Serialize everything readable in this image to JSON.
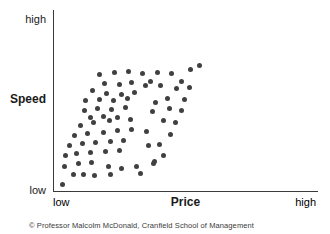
{
  "chart": {
    "y_axis": {
      "top_tick": "high",
      "label": "Speed",
      "bottom_tick": "low"
    },
    "x_axis": {
      "left_tick": "low",
      "label": "Price",
      "right_tick": "high"
    },
    "footer": "© Professor Malcolm McDonald, Cranfield School of Management",
    "colors": {
      "background": "#ffffff",
      "dot": "#404040",
      "axis": "#3a3a3a",
      "text": "#1a1a1a",
      "footer_text": "#3a3a3a"
    }
  },
  "chart_data": {
    "type": "scatter",
    "title": "",
    "xlabel": "Price",
    "ylabel": "Speed",
    "x_range_labels": [
      "low",
      "high"
    ],
    "y_range_labels": [
      "low",
      "high"
    ],
    "axes_quantitative": false,
    "x_range": [
      0,
      1
    ],
    "y_range": [
      0,
      1
    ],
    "grid": false,
    "legend": "none",
    "annotation": "© Professor Malcolm McDonald, Cranfield School of Management",
    "points": [
      [
        0.551,
        0.692
      ],
      [
        0.517,
        0.67
      ],
      [
        0.445,
        0.648
      ],
      [
        0.392,
        0.654
      ],
      [
        0.483,
        0.604
      ],
      [
        0.404,
        0.582
      ],
      [
        0.366,
        0.604
      ],
      [
        0.174,
        0.643
      ],
      [
        0.23,
        0.654
      ],
      [
        0.283,
        0.659
      ],
      [
        0.336,
        0.648
      ],
      [
        0.192,
        0.593
      ],
      [
        0.249,
        0.588
      ],
      [
        0.294,
        0.599
      ],
      [
        0.347,
        0.582
      ],
      [
        0.464,
        0.566
      ],
      [
        0.513,
        0.571
      ],
      [
        0.147,
        0.555
      ],
      [
        0.2,
        0.538
      ],
      [
        0.257,
        0.533
      ],
      [
        0.306,
        0.544
      ],
      [
        0.43,
        0.511
      ],
      [
        0.494,
        0.505
      ],
      [
        0.121,
        0.5
      ],
      [
        0.174,
        0.505
      ],
      [
        0.226,
        0.5
      ],
      [
        0.279,
        0.511
      ],
      [
        0.385,
        0.489
      ],
      [
        0.117,
        0.445
      ],
      [
        0.166,
        0.456
      ],
      [
        0.219,
        0.451
      ],
      [
        0.272,
        0.462
      ],
      [
        0.374,
        0.44
      ],
      [
        0.438,
        0.456
      ],
      [
        0.483,
        0.445
      ],
      [
        0.14,
        0.407
      ],
      [
        0.189,
        0.412
      ],
      [
        0.242,
        0.407
      ],
      [
        0.291,
        0.396
      ],
      [
        0.415,
        0.39
      ],
      [
        0.46,
        0.379
      ],
      [
        0.102,
        0.363
      ],
      [
        0.151,
        0.379
      ],
      [
        0.211,
        0.39
      ],
      [
        0.079,
        0.308
      ],
      [
        0.128,
        0.319
      ],
      [
        0.189,
        0.324
      ],
      [
        0.242,
        0.335
      ],
      [
        0.294,
        0.341
      ],
      [
        0.351,
        0.33
      ],
      [
        0.442,
        0.313
      ],
      [
        0.057,
        0.253
      ],
      [
        0.109,
        0.264
      ],
      [
        0.158,
        0.269
      ],
      [
        0.215,
        0.275
      ],
      [
        0.264,
        0.28
      ],
      [
        0.358,
        0.253
      ],
      [
        0.4,
        0.258
      ],
      [
        0.045,
        0.198
      ],
      [
        0.087,
        0.209
      ],
      [
        0.14,
        0.214
      ],
      [
        0.196,
        0.22
      ],
      [
        0.249,
        0.225
      ],
      [
        0.415,
        0.198
      ],
      [
        0.038,
        0.137
      ],
      [
        0.091,
        0.154
      ],
      [
        0.143,
        0.159
      ],
      [
        0.208,
        0.137
      ],
      [
        0.257,
        0.126
      ],
      [
        0.313,
        0.137
      ],
      [
        0.377,
        0.154
      ],
      [
        0.075,
        0.093
      ],
      [
        0.113,
        0.093
      ],
      [
        0.155,
        0.088
      ],
      [
        0.215,
        0.093
      ],
      [
        0.328,
        0.099
      ],
      [
        0.381,
        0.165
      ],
      [
        0.034,
        0.038
      ]
    ]
  }
}
